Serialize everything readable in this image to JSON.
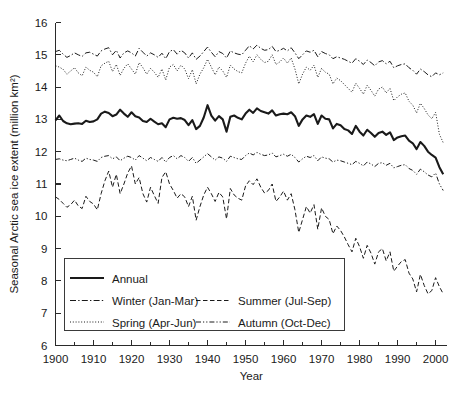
{
  "chart_data": {
    "type": "line",
    "title": "",
    "xlabel": "Year",
    "ylabel": "Seasonal Arctic sea ice extent (million km²)",
    "xlim": [
      1900,
      2003
    ],
    "ylim": [
      6,
      16
    ],
    "xticks": [
      1900,
      1910,
      1920,
      1930,
      1940,
      1950,
      1960,
      1970,
      1980,
      1990,
      2000
    ],
    "xtick_labels": [
      "1900",
      "1910",
      "1920",
      "1930",
      "1940",
      "1950",
      "1960",
      "1970",
      "1980",
      "1990",
      "2000"
    ],
    "xminor_step": 5,
    "yticks": [
      6,
      7,
      8,
      9,
      10,
      11,
      12,
      13,
      14,
      15,
      16
    ],
    "ytick_labels": [
      "6",
      "7",
      "8",
      "9",
      "10",
      "11",
      "12",
      "13",
      "14",
      "15",
      "16"
    ],
    "grid": false,
    "legend_position": "lower-left-inside",
    "x": [
      1900,
      1901,
      1902,
      1903,
      1904,
      1905,
      1906,
      1907,
      1908,
      1909,
      1910,
      1911,
      1912,
      1913,
      1914,
      1915,
      1916,
      1917,
      1918,
      1919,
      1920,
      1921,
      1922,
      1923,
      1924,
      1925,
      1926,
      1927,
      1928,
      1929,
      1930,
      1931,
      1932,
      1933,
      1934,
      1935,
      1936,
      1937,
      1938,
      1939,
      1940,
      1941,
      1942,
      1943,
      1944,
      1945,
      1946,
      1947,
      1948,
      1949,
      1950,
      1951,
      1952,
      1953,
      1954,
      1955,
      1956,
      1957,
      1958,
      1959,
      1960,
      1961,
      1962,
      1963,
      1964,
      1965,
      1966,
      1967,
      1968,
      1969,
      1970,
      1971,
      1972,
      1973,
      1974,
      1975,
      1976,
      1977,
      1978,
      1979,
      1980,
      1981,
      1982,
      1983,
      1984,
      1985,
      1986,
      1987,
      1988,
      1989,
      1990,
      1991,
      1992,
      1993,
      1994,
      1995,
      1996,
      1997,
      1998,
      1999,
      2000,
      2001,
      2002
    ],
    "series": [
      {
        "name": "Annual",
        "label": "Annual",
        "style": "solid",
        "linewidth": 2.1,
        "values": [
          12.97,
          13.12,
          12.95,
          12.88,
          12.85,
          12.87,
          12.88,
          12.86,
          12.96,
          12.92,
          12.94,
          13.0,
          13.18,
          13.24,
          13.2,
          13.1,
          13.15,
          13.3,
          13.18,
          13.08,
          13.22,
          13.1,
          13.06,
          12.95,
          12.92,
          13.02,
          12.93,
          12.85,
          12.88,
          12.76,
          13.0,
          13.05,
          13.02,
          13.04,
          12.98,
          12.82,
          12.98,
          12.7,
          12.8,
          13.06,
          13.44,
          13.12,
          12.96,
          13.1,
          13.0,
          12.62,
          13.08,
          13.12,
          13.05,
          13.0,
          13.18,
          13.3,
          13.2,
          13.34,
          13.26,
          13.22,
          13.18,
          13.28,
          13.12,
          13.16,
          13.18,
          13.16,
          13.22,
          13.1,
          12.8,
          13.0,
          13.12,
          13.08,
          13.16,
          12.86,
          13.12,
          13.02,
          13.0,
          12.72,
          12.86,
          12.82,
          12.7,
          12.66,
          12.55,
          12.8,
          12.62,
          12.5,
          12.68,
          12.58,
          12.46,
          12.58,
          12.62,
          12.52,
          12.6,
          12.36,
          12.44,
          12.48,
          12.5,
          12.34,
          12.26,
          12.08,
          12.3,
          12.18,
          12.0,
          11.9,
          11.82,
          11.52,
          11.3
        ]
      },
      {
        "name": "Winter (Jan-Mar)",
        "label": "Winter (Jan-Mar)",
        "style": "dashdot",
        "linewidth": 1.0,
        "values": [
          15.1,
          15.14,
          15.02,
          14.92,
          14.98,
          15.06,
          15.0,
          14.95,
          15.06,
          15.08,
          15.02,
          14.96,
          15.12,
          15.18,
          15.22,
          15.0,
          15.14,
          14.9,
          15.06,
          15.12,
          15.06,
          14.96,
          15.2,
          15.08,
          14.96,
          15.06,
          15.0,
          14.92,
          15.05,
          14.88,
          15.1,
          15.16,
          15.02,
          15.14,
          15.06,
          14.9,
          15.06,
          14.86,
          14.96,
          15.1,
          15.24,
          15.08,
          14.94,
          15.1,
          15.04,
          14.9,
          15.12,
          15.06,
          15.02,
          15.0,
          15.14,
          15.28,
          15.18,
          15.3,
          15.2,
          15.14,
          15.16,
          15.26,
          15.1,
          15.14,
          15.2,
          15.12,
          15.22,
          15.06,
          14.88,
          15.0,
          15.12,
          15.08,
          15.14,
          14.94,
          15.1,
          15.04,
          15.0,
          14.88,
          14.94,
          14.9,
          14.86,
          14.8,
          14.74,
          14.88,
          14.8,
          14.7,
          14.84,
          14.76,
          14.66,
          14.78,
          14.82,
          14.72,
          14.8,
          14.6,
          14.66,
          14.7,
          14.72,
          14.6,
          14.52,
          14.4,
          14.56,
          14.48,
          14.38,
          14.32,
          14.44,
          14.38,
          14.44
        ]
      },
      {
        "name": "Spring (Apr-Jun)",
        "label": "Spring (Apr-Jun)",
        "style": "dotted",
        "linewidth": 1.0,
        "values": [
          14.66,
          14.62,
          14.55,
          14.4,
          14.5,
          14.6,
          14.44,
          14.35,
          14.62,
          14.52,
          14.46,
          14.32,
          14.66,
          14.74,
          14.8,
          14.48,
          14.7,
          14.36,
          14.58,
          14.72,
          14.56,
          14.4,
          14.76,
          14.6,
          14.4,
          14.58,
          14.46,
          14.3,
          14.56,
          14.22,
          14.62,
          14.7,
          14.5,
          14.68,
          14.56,
          14.26,
          14.54,
          14.1,
          14.4,
          14.6,
          14.86,
          14.62,
          14.38,
          14.62,
          14.5,
          14.3,
          14.68,
          14.56,
          14.48,
          14.44,
          14.74,
          14.96,
          14.78,
          15.0,
          14.86,
          14.76,
          14.8,
          15.0,
          14.7,
          14.78,
          14.9,
          14.74,
          14.9,
          14.56,
          14.1,
          14.4,
          14.62,
          14.52,
          14.68,
          14.3,
          14.58,
          14.46,
          14.4,
          14.1,
          14.28,
          14.2,
          14.08,
          13.96,
          13.84,
          14.12,
          13.96,
          13.78,
          14.06,
          13.9,
          13.72,
          13.94,
          14.0,
          13.82,
          13.96,
          13.58,
          13.7,
          13.78,
          13.82,
          13.56,
          13.44,
          13.2,
          13.5,
          13.34,
          13.14,
          13.02,
          13.22,
          12.54,
          12.28
        ]
      },
      {
        "name": "Summer (Jul-Sep)",
        "label": "Summer (Jul-Sep)",
        "style": "dashed",
        "linewidth": 1.0,
        "values": [
          10.6,
          10.52,
          10.4,
          10.28,
          10.36,
          10.5,
          10.32,
          10.24,
          10.62,
          10.46,
          10.38,
          10.2,
          10.7,
          11.1,
          11.4,
          10.9,
          11.3,
          10.7,
          11.0,
          11.34,
          11.56,
          11.0,
          11.2,
          10.7,
          10.44,
          10.9,
          10.64,
          10.4,
          11.2,
          11.38,
          11.0,
          10.8,
          10.56,
          10.7,
          10.6,
          10.3,
          10.62,
          9.88,
          10.3,
          10.66,
          10.9,
          10.7,
          10.46,
          10.74,
          10.6,
          9.92,
          10.86,
          10.66,
          10.56,
          10.5,
          10.94,
          11.1,
          10.98,
          11.16,
          10.9,
          10.72,
          10.8,
          11.0,
          10.46,
          10.6,
          10.78,
          10.5,
          10.7,
          10.2,
          9.5,
          9.9,
          10.3,
          10.1,
          10.36,
          9.6,
          10.26,
          10.0,
          9.9,
          9.46,
          9.7,
          9.56,
          9.36,
          9.12,
          8.9,
          9.32,
          9.06,
          8.7,
          9.1,
          8.86,
          8.52,
          8.9,
          9.0,
          8.62,
          8.9,
          8.3,
          8.46,
          8.6,
          8.66,
          8.24,
          8.06,
          7.66,
          8.2,
          7.86,
          7.6,
          7.7,
          8.1,
          7.82,
          7.6
        ]
      },
      {
        "name": "Autumn (Oct-Dec)",
        "label": "Autumn (Oct-Dec)",
        "style": "dashdotdot",
        "linewidth": 1.0,
        "values": [
          11.76,
          11.78,
          11.74,
          11.72,
          11.76,
          11.8,
          11.74,
          11.7,
          11.8,
          11.76,
          11.74,
          11.7,
          11.82,
          11.86,
          11.88,
          11.78,
          11.84,
          11.72,
          11.8,
          11.86,
          11.82,
          11.74,
          11.88,
          11.8,
          11.72,
          11.82,
          11.76,
          11.7,
          11.82,
          11.68,
          11.82,
          11.88,
          11.78,
          11.88,
          11.82,
          11.7,
          11.82,
          11.64,
          11.74,
          11.84,
          11.94,
          11.84,
          11.74,
          11.84,
          11.8,
          11.7,
          11.86,
          11.82,
          11.78,
          11.76,
          11.88,
          11.96,
          11.9,
          11.98,
          11.92,
          11.88,
          11.9,
          11.96,
          11.84,
          11.88,
          11.92,
          11.86,
          11.92,
          11.82,
          11.68,
          11.78,
          11.86,
          11.82,
          11.88,
          11.72,
          11.84,
          11.8,
          11.78,
          11.68,
          11.74,
          11.72,
          11.68,
          11.64,
          11.6,
          11.7,
          11.64,
          11.56,
          11.68,
          11.62,
          11.54,
          11.64,
          11.66,
          11.58,
          11.64,
          11.5,
          11.54,
          11.58,
          11.6,
          11.48,
          11.42,
          11.3,
          11.46,
          11.38,
          11.28,
          11.22,
          11.34,
          11.0,
          10.8
        ]
      }
    ],
    "legend": {
      "entries": [
        {
          "label": "Annual",
          "style": "solid"
        },
        {
          "label": "Winter (Jan-Mar)",
          "style": "dashdot"
        },
        {
          "label": "Summer (Jul-Sep)",
          "style": "dashed"
        },
        {
          "label": "Spring (Apr-Jun)",
          "style": "dotted"
        },
        {
          "label": "Autumn (Oct-Dec)",
          "style": "dashdotdot"
        }
      ]
    }
  }
}
